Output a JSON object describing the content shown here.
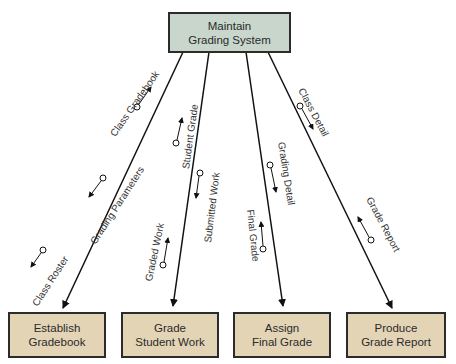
{
  "diagram": {
    "type": "structure-chart",
    "colors": {
      "top_box": "#c8d6cc",
      "bottom_box": "#e3d4b6",
      "border": "#2b2b2b"
    },
    "top_module": {
      "line1": "Maintain",
      "line2": "Grading System"
    },
    "modules": [
      {
        "line1": "Establish",
        "line2": "Gradebook"
      },
      {
        "line1": "Grade",
        "line2": "Student Work"
      },
      {
        "line1": "Assign",
        "line2": "Final Grade"
      },
      {
        "line1": "Produce",
        "line2": "Grade Report"
      }
    ],
    "couples": {
      "class_gradebook": "Class Gradebook",
      "grading_parameters": "Grading Parameters",
      "class_roster": "Class Roster",
      "student_grade": "Student Grade",
      "submitted_work": "Submitted Work",
      "graded_work": "Graded Work",
      "grading_detail": "Grading Detail",
      "final_grade": "Final Grade",
      "class_detail": "Class Detail",
      "grade_report": "Grade Report"
    }
  }
}
